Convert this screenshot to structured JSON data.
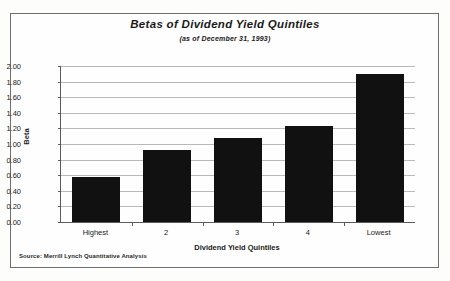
{
  "chart_data": {
    "type": "bar",
    "title": "Betas of Dividend Yield Quintiles",
    "subtitle": "(as of December 31, 1993)",
    "xlabel": "Dividend Yield Quintiles",
    "ylabel": "Beta",
    "categories": [
      "Highest",
      "2",
      "3",
      "4",
      "Lowest"
    ],
    "values": [
      0.58,
      0.92,
      1.08,
      1.23,
      1.9
    ],
    "ylim": [
      0.0,
      2.0
    ],
    "ytick_step": 0.2,
    "ytick_labels": [
      "2.00",
      "1.80",
      "1.60",
      "1.40",
      "1.20",
      "1.00",
      "0.80",
      "0.60",
      "0.40",
      "0.20",
      "0.00"
    ],
    "ytick_values": [
      2.0,
      1.8,
      1.6,
      1.4,
      1.2,
      1.0,
      0.8,
      0.6,
      0.4,
      0.2,
      0.0
    ],
    "grid": true,
    "legend": false,
    "bar_color": "#111111",
    "gridline_color": "#b9b9b9",
    "axis_color": "#5a5a5a"
  },
  "source": {
    "note": "Source: Merrill Lynch Quantitative Analysis"
  }
}
